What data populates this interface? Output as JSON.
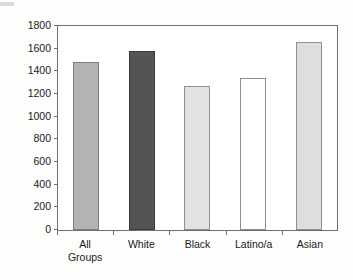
{
  "chart_data": {
    "type": "bar",
    "title": "",
    "subtitle": "",
    "xlabel": "",
    "ylabel": "",
    "categories": [
      "All Groups",
      "White",
      "Black",
      "Latino/a",
      "Asian"
    ],
    "category_lines": [
      [
        "All",
        "Groups"
      ],
      [
        "White"
      ],
      [
        "Black"
      ],
      [
        "Latino/a"
      ],
      [
        "Asian"
      ]
    ],
    "values": [
      1480,
      1580,
      1270,
      1340,
      1660
    ],
    "ylim": [
      0,
      1800
    ],
    "y_ticks": [
      1800,
      1600,
      1400,
      1200,
      1000,
      800,
      600,
      400,
      200,
      0
    ],
    "y_tick_labels": [
      "1800",
      "1600",
      "1400",
      "1200",
      "1000",
      "800",
      "600",
      "400",
      "200",
      "0"
    ],
    "grid": false,
    "legend": "none",
    "bar_colors": [
      "#b3b3b3",
      "#545454",
      "#e2e2e2",
      "#ffffff",
      "#dedede"
    ],
    "bar_border_colors": [
      "#7d7d7d",
      "#3a3a3a",
      "#8f8f8f",
      "#8f8f8f",
      "#8f8f8f"
    ],
    "frame_color": "#6f6f6f",
    "background_color": "#ffffff"
  }
}
